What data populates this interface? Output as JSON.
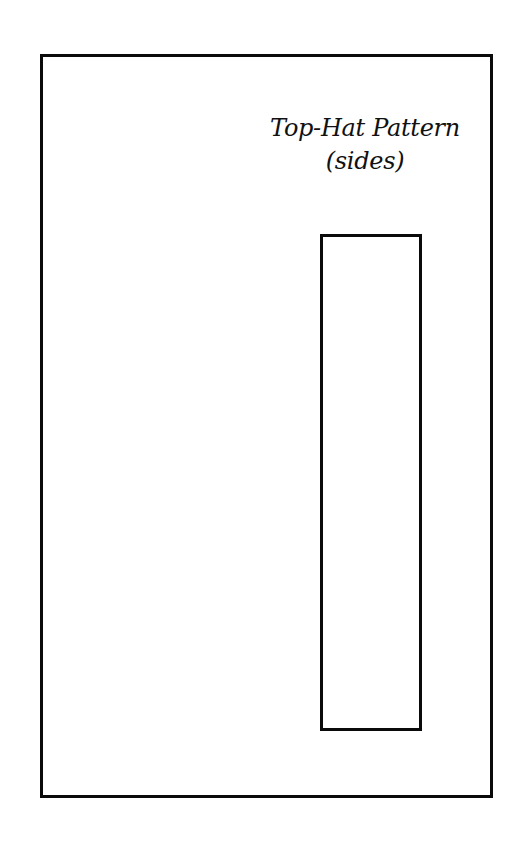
{
  "document": {
    "title_line1": "Top-Hat Pattern",
    "title_line2": "(sides)"
  },
  "shapes": {
    "outer_frame": {
      "stroke": "#0a0a0a",
      "fill": "#ffffff"
    },
    "pattern_rect": {
      "stroke": "#0a0a0a",
      "fill": "#ffffff"
    }
  }
}
